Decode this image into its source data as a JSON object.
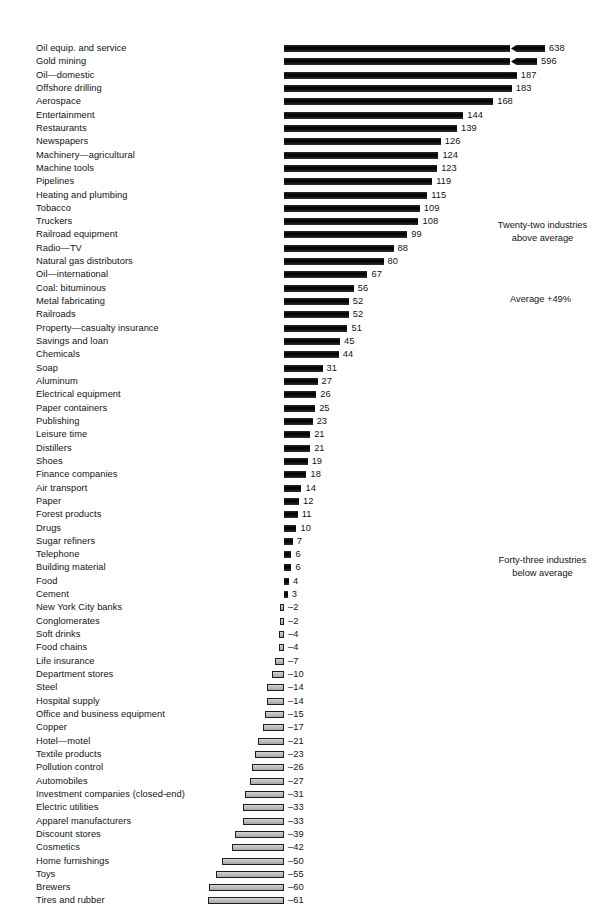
{
  "chart_data": {
    "type": "bar",
    "orientation": "horizontal",
    "title": "",
    "xlabel": "",
    "ylabel": "",
    "grid": false,
    "legend": null,
    "xlim": [
      -70,
      200
    ],
    "value_suffix": "%",
    "baseline": 0,
    "axis_break": {
      "present": true,
      "applies_to": [
        "Oil equip. and service",
        "Gold mining"
      ],
      "note": "zigzag break mark near right end of the two longest bars"
    },
    "categories": [
      "Oil equip. and service",
      "Gold mining",
      "Oil—domestic",
      "Offshore drilling",
      "Aerospace",
      "Entertainment",
      "Restaurants",
      "Newspapers",
      "Machinery—agricultural",
      "Machine tools",
      "Pipelines",
      "Heating and plumbing",
      "Tobacco",
      "Truckers",
      "Railroad equipment",
      "Radio—TV",
      "Natural gas distributors",
      "Oil—international",
      "Coal: bituminous",
      "Metal fabricating",
      "Railroads",
      "Property—casualty insurance",
      "Savings and loan",
      "Chemicals",
      "Soap",
      "Aluminum",
      "Electrical equipment",
      "Paper containers",
      "Publishing",
      "Leisure time",
      "Distillers",
      "Shoes",
      "Finance companies",
      "Air transport",
      "Paper",
      "Forest products",
      "Drugs",
      "Sugar refiners",
      "Telephone",
      "Building material",
      "Food",
      "Cement",
      "New York City banks",
      "Conglomerates",
      "Soft drinks",
      "Food chains",
      "Life insurance",
      "Department stores",
      "Steel",
      "Hospital supply",
      "Office and business equipment",
      "Copper",
      "Hotel—motel",
      "Textile products",
      "Pollution control",
      "Automobiles",
      "Investment companies (closed-end)",
      "Electric utilities",
      "Apparel manufacturers",
      "Discount stores",
      "Cosmetics",
      "Home furnishings",
      "Toys",
      "Brewers",
      "Tires and rubber"
    ],
    "values": [
      638,
      596,
      187,
      183,
      168,
      144,
      139,
      126,
      124,
      123,
      119,
      115,
      109,
      108,
      99,
      88,
      80,
      67,
      56,
      52,
      52,
      51,
      45,
      44,
      31,
      27,
      26,
      25,
      23,
      21,
      21,
      19,
      18,
      14,
      12,
      11,
      10,
      7,
      6,
      6,
      4,
      3,
      -2,
      -2,
      -4,
      -4,
      -7,
      -10,
      -14,
      -14,
      -15,
      -17,
      -21,
      -23,
      -26,
      -27,
      -31,
      -33,
      -33,
      -39,
      -42,
      -50,
      -55,
      -60,
      -61
    ],
    "value_labels": [
      "638",
      "596",
      "187",
      "183",
      "168",
      "144",
      "139",
      "126",
      "124",
      "123",
      "119",
      "115",
      "109",
      "108",
      "99",
      "88",
      "80",
      "67",
      "56",
      "52",
      "52",
      "51",
      "45",
      "44",
      "31",
      "27",
      "26",
      "25",
      "23",
      "21",
      "21",
      "19",
      "18",
      "14",
      "12",
      "11",
      "10",
      "7",
      "6",
      "6",
      "4",
      "3",
      "–2",
      "–2",
      "–4",
      "–4",
      "–7",
      "–10",
      "–14",
      "–14",
      "–15",
      "–17",
      "–21",
      "–23",
      "–26",
      "–27",
      "–31",
      "–33",
      "–33",
      "–39",
      "–42",
      "–50",
      "–55",
      "–60",
      "–61"
    ],
    "annotations": [
      {
        "name": "above-average-note",
        "line1": "Twenty-two industries",
        "line2": "above average"
      },
      {
        "name": "average-note",
        "line1": "Average +49%",
        "line2": ""
      },
      {
        "name": "below-average-note",
        "line1": "Forty-three industries",
        "line2": "below average"
      }
    ],
    "colors": {
      "positive_bar": "#161616",
      "negative_bar": "#bdbdbd",
      "negative_outline": "#1d1d1d",
      "text": "#131313",
      "background": "#ffffff"
    }
  }
}
